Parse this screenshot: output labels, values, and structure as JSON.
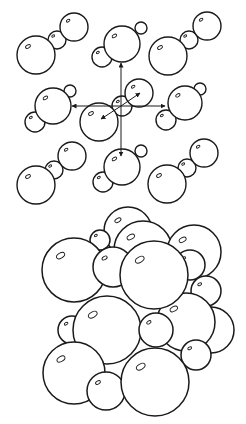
{
  "figure": {
    "stroke_color": "#1a1a1a",
    "background": "#ffffff",
    "lattice": {
      "molecules": [
        {
          "id": "top-left",
          "atoms": [
            {
              "cx": 36,
              "cy": 55,
              "r": 19
            },
            {
              "cx": 57,
              "cy": 40,
              "r": 9
            },
            {
              "cx": 74,
              "cy": 27,
              "r": 14
            }
          ]
        },
        {
          "id": "top-center",
          "atoms": [
            {
              "cx": 122,
              "cy": 44,
              "r": 18
            },
            {
              "cx": 102,
              "cy": 57,
              "r": 10
            },
            {
              "cx": 141,
              "cy": 28,
              "r": 6
            }
          ]
        },
        {
          "id": "top-right",
          "atoms": [
            {
              "cx": 168,
              "cy": 56,
              "r": 19
            },
            {
              "cx": 189,
              "cy": 40,
              "r": 9
            },
            {
              "cx": 207,
              "cy": 26,
              "r": 14
            }
          ]
        },
        {
          "id": "mid-left",
          "atoms": [
            {
              "cx": 53,
              "cy": 106,
              "r": 18
            },
            {
              "cx": 35,
              "cy": 122,
              "r": 10
            },
            {
              "cx": 70,
              "cy": 91,
              "r": 6
            }
          ]
        },
        {
          "id": "center",
          "atoms": [
            {
              "cx": 99,
              "cy": 122,
              "r": 19
            },
            {
              "cx": 122,
              "cy": 106,
              "r": 10
            },
            {
              "cx": 139,
              "cy": 93,
              "r": 14
            }
          ]
        },
        {
          "id": "mid-right",
          "atoms": [
            {
              "cx": 185,
              "cy": 103,
              "r": 17
            },
            {
              "cx": 166,
              "cy": 120,
              "r": 10
            },
            {
              "cx": 200,
              "cy": 89,
              "r": 6
            }
          ]
        },
        {
          "id": "bottom-left",
          "atoms": [
            {
              "cx": 36,
              "cy": 185,
              "r": 19
            },
            {
              "cx": 54,
              "cy": 170,
              "r": 9
            },
            {
              "cx": 72,
              "cy": 156,
              "r": 14
            }
          ]
        },
        {
          "id": "bottom-center",
          "atoms": [
            {
              "cx": 122,
              "cy": 167,
              "r": 18
            },
            {
              "cx": 103,
              "cy": 182,
              "r": 10
            },
            {
              "cx": 141,
              "cy": 151,
              "r": 6
            }
          ]
        },
        {
          "id": "bottom-right",
          "atoms": [
            {
              "cx": 167,
              "cy": 184,
              "r": 19
            },
            {
              "cx": 187,
              "cy": 168,
              "r": 9
            },
            {
              "cx": 204,
              "cy": 153,
              "r": 14
            }
          ]
        }
      ],
      "arrows": [
        {
          "id": "arrow-up",
          "x1": 121,
          "y1": 106,
          "x2": 121,
          "y2": 63
        },
        {
          "id": "arrow-down",
          "x1": 121,
          "y1": 106,
          "x2": 121,
          "y2": 156
        },
        {
          "id": "arrow-left",
          "x1": 121,
          "y1": 106,
          "x2": 72,
          "y2": 106
        },
        {
          "id": "arrow-right",
          "x1": 121,
          "y1": 106,
          "x2": 165,
          "y2": 106
        },
        {
          "id": "arrow-ne",
          "x1": 121,
          "y1": 106,
          "x2": 140,
          "y2": 93
        },
        {
          "id": "arrow-sw",
          "x1": 121,
          "y1": 106,
          "x2": 101,
          "y2": 119
        }
      ]
    },
    "cluster": {
      "atoms": [
        {
          "cx": 128,
          "cy": 231,
          "r": 24
        },
        {
          "cx": 200,
          "cy": 238,
          "r": 10
        },
        {
          "cx": 100,
          "cy": 240,
          "r": 10
        },
        {
          "cx": 143,
          "cy": 250,
          "r": 29
        },
        {
          "cx": 194,
          "cy": 252,
          "r": 27
        },
        {
          "cx": 74,
          "cy": 270,
          "r": 32
        },
        {
          "cx": 190,
          "cy": 265,
          "r": 15
        },
        {
          "cx": 206,
          "cy": 291,
          "r": 15
        },
        {
          "cx": 211,
          "cy": 330,
          "r": 23
        },
        {
          "cx": 186,
          "cy": 322,
          "r": 29
        },
        {
          "cx": 113,
          "cy": 267,
          "r": 20
        },
        {
          "cx": 154,
          "cy": 275,
          "r": 34
        },
        {
          "cx": 72,
          "cy": 330,
          "r": 14
        },
        {
          "cx": 196,
          "cy": 355,
          "r": 15
        },
        {
          "cx": 107,
          "cy": 330,
          "r": 34
        },
        {
          "cx": 156,
          "cy": 330,
          "r": 17
        },
        {
          "cx": 74,
          "cy": 373,
          "r": 31
        },
        {
          "cx": 106,
          "cy": 391,
          "r": 19
        },
        {
          "cx": 155,
          "cy": 382,
          "r": 34
        }
      ]
    }
  }
}
